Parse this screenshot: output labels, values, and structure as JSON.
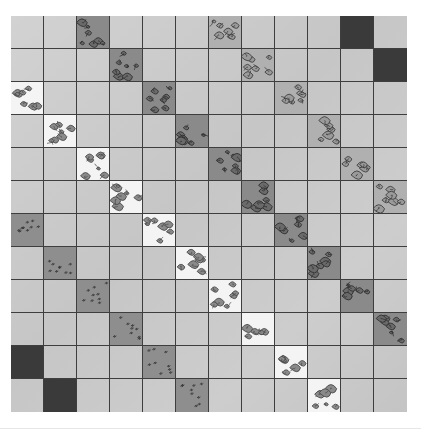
{
  "artwork": {
    "description": "Painted grid of 12x12 square tiles with diagonal bands of patterned tiles",
    "grid": {
      "rows": 12,
      "cols": 12
    },
    "colors": {
      "background": "#ffffff",
      "plain_tile": "#cccccc",
      "grid_line": "#3e3e3e",
      "black_tile": "#3a3a3a",
      "dash_tile": "#8e8e8e",
      "white_floral_tile": "#f4f4f4",
      "medium_floral_tile": "#b0b0b0",
      "dark_floral_tile": "#8a8a8a"
    },
    "tiles": [
      {
        "row": 0,
        "col": 2,
        "type": "dark-floral"
      },
      {
        "row": 0,
        "col": 6,
        "type": "medium-floral"
      },
      {
        "row": 0,
        "col": 10,
        "type": "black"
      },
      {
        "row": 1,
        "col": 3,
        "type": "dark-floral"
      },
      {
        "row": 1,
        "col": 7,
        "type": "medium-floral"
      },
      {
        "row": 1,
        "col": 11,
        "type": "black"
      },
      {
        "row": 2,
        "col": 0,
        "type": "white-floral"
      },
      {
        "row": 2,
        "col": 4,
        "type": "dark-floral"
      },
      {
        "row": 2,
        "col": 8,
        "type": "medium-floral"
      },
      {
        "row": 3,
        "col": 1,
        "type": "white-floral"
      },
      {
        "row": 3,
        "col": 5,
        "type": "dark-floral"
      },
      {
        "row": 3,
        "col": 9,
        "type": "medium-floral"
      },
      {
        "row": 4,
        "col": 2,
        "type": "white-floral"
      },
      {
        "row": 4,
        "col": 6,
        "type": "dark-floral"
      },
      {
        "row": 4,
        "col": 10,
        "type": "medium-floral"
      },
      {
        "row": 5,
        "col": 3,
        "type": "white-floral"
      },
      {
        "row": 5,
        "col": 7,
        "type": "dark-floral"
      },
      {
        "row": 5,
        "col": 11,
        "type": "medium-floral"
      },
      {
        "row": 6,
        "col": 0,
        "type": "dash"
      },
      {
        "row": 6,
        "col": 4,
        "type": "white-floral"
      },
      {
        "row": 6,
        "col": 8,
        "type": "dark-floral"
      },
      {
        "row": 7,
        "col": 1,
        "type": "dash"
      },
      {
        "row": 7,
        "col": 5,
        "type": "white-floral"
      },
      {
        "row": 7,
        "col": 9,
        "type": "dark-floral"
      },
      {
        "row": 8,
        "col": 2,
        "type": "dash"
      },
      {
        "row": 8,
        "col": 6,
        "type": "white-floral"
      },
      {
        "row": 8,
        "col": 10,
        "type": "dark-floral"
      },
      {
        "row": 9,
        "col": 3,
        "type": "dash"
      },
      {
        "row": 9,
        "col": 7,
        "type": "white-floral"
      },
      {
        "row": 9,
        "col": 11,
        "type": "dark-floral"
      },
      {
        "row": 10,
        "col": 0,
        "type": "black"
      },
      {
        "row": 10,
        "col": 4,
        "type": "dash"
      },
      {
        "row": 10,
        "col": 8,
        "type": "white-floral"
      },
      {
        "row": 11,
        "col": 1,
        "type": "black"
      },
      {
        "row": 11,
        "col": 5,
        "type": "dash"
      },
      {
        "row": 11,
        "col": 9,
        "type": "white-floral"
      }
    ]
  }
}
